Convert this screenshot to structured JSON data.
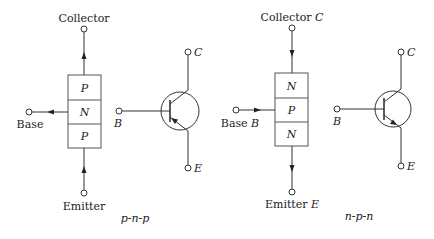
{
  "left": {
    "type_label": "p-n-p",
    "collector_label": "Collector",
    "base_label": "Base",
    "emitter_label": "Emitter",
    "layers": [
      "P",
      "N",
      "P"
    ],
    "symbol": {
      "c_label": "C",
      "b_label": "B",
      "e_label": "E"
    }
  },
  "right": {
    "type_label": "n-p-n",
    "collector_label": "Collector",
    "collector_letter": "C",
    "base_label": "Base",
    "base_letter": "B",
    "emitter_label": "Emitter",
    "emitter_letter": "E",
    "layers": [
      "N",
      "P",
      "N"
    ],
    "symbol": {
      "c_label": "C",
      "b_label": "B",
      "e_label": "E"
    }
  }
}
